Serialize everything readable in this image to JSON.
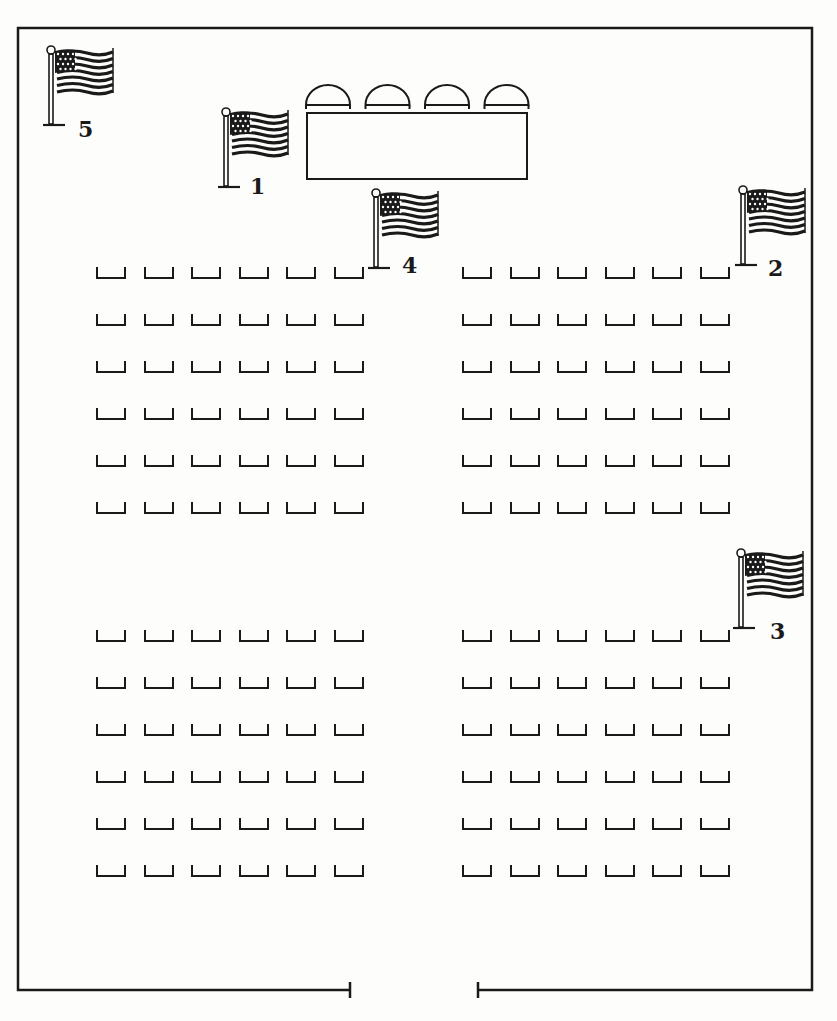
{
  "diagram": {
    "colors": {
      "ink": "#1a1a1a",
      "paper": "#fdfdfb"
    },
    "walls": {
      "left": 18,
      "right": 812,
      "top": 28,
      "bottom": 990,
      "door_gap": [
        350,
        478
      ]
    },
    "head_table": {
      "x": 307,
      "y": 113,
      "w": 220,
      "h": 66,
      "chairs": 4
    },
    "flags": [
      {
        "id": "1",
        "label": "1",
        "x": 218,
        "y": 107,
        "label_x": 250,
        "label_y": 175
      },
      {
        "id": "2",
        "label": "2",
        "x": 735,
        "y": 185,
        "label_x": 768,
        "label_y": 257
      },
      {
        "id": "3",
        "label": "3",
        "x": 733,
        "y": 548,
        "label_x": 770,
        "label_y": 620
      },
      {
        "id": "4",
        "label": "4",
        "x": 368,
        "y": 188,
        "label_x": 402,
        "label_y": 254
      },
      {
        "id": "5",
        "label": "5",
        "x": 43,
        "y": 45,
        "label_x": 78,
        "label_y": 118
      }
    ],
    "seating_blocks": [
      {
        "name": "front-left",
        "x0": 96,
        "y0": 267,
        "rows": 6,
        "cols": 6
      },
      {
        "name": "front-right",
        "x0": 462,
        "y0": 267,
        "rows": 6,
        "cols": 6
      },
      {
        "name": "back-left",
        "x0": 96,
        "y0": 630,
        "rows": 6,
        "cols": 6
      },
      {
        "name": "back-right",
        "x0": 462,
        "y0": 630,
        "rows": 6,
        "cols": 6
      }
    ],
    "chair_spacing": {
      "dx": 47.5,
      "dy": 47
    }
  }
}
